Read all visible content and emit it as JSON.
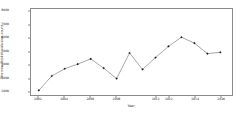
{
  "chart_data": {
    "type": "line",
    "title": "",
    "xlabel": "Year",
    "ylabel": "The new Publish collusion count",
    "x": [
      2002,
      2003,
      2004,
      2005,
      2006,
      2007,
      2008,
      2009,
      2010,
      2011,
      2012,
      2013,
      2014,
      2015,
      2016
    ],
    "values": [
      2050,
      3150,
      3700,
      4050,
      4450,
      3750,
      2950,
      4900,
      3650,
      4550,
      5400,
      6100,
      5650,
      4850,
      4950
    ],
    "series": [
      {
        "name": "The new Publish collusion count",
        "values": [
          2050,
          3150,
          3700,
          4050,
          4450,
          3750,
          2950,
          4900,
          3650,
          4550,
          5400,
          6100,
          5650,
          4850,
          4950
        ]
      }
    ],
    "xlim": [
      2001.4,
      2016.9
    ],
    "ylim": [
      1700,
      8250
    ],
    "yticks": [
      2000,
      3000,
      4000,
      5000,
      6000,
      7000,
      8000
    ],
    "ytick_labels": [
      "2000",
      "3000",
      "4000",
      "5000",
      "6000",
      "7000",
      "8000"
    ],
    "xticks": [
      2002,
      2004,
      2006,
      2008,
      2011,
      2012,
      2014,
      2016
    ],
    "xtick_labels": [
      "2002",
      "2004",
      "2006",
      "2008",
      "2011",
      "2012",
      "2014",
      "2016"
    ],
    "grid": false,
    "legend": "none",
    "line_color": "#3b3b3b",
    "marker": "circle",
    "marker_color": "#1a1a1a",
    "axes_color": "#8a8a8a",
    "background": "#ffffff"
  }
}
